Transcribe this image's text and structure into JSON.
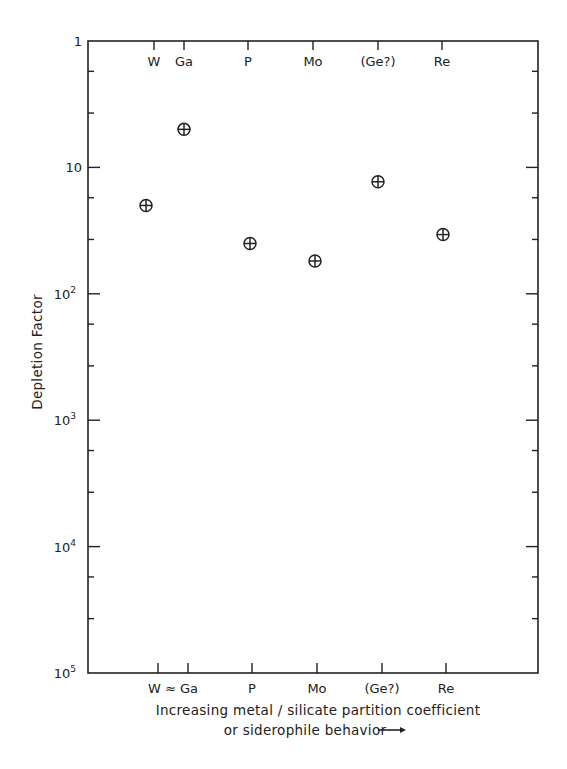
{
  "chart_data": {
    "type": "scatter",
    "title": "",
    "ylabel": "Depletion Factor",
    "xlabel_line1": "Increasing metal / silicate partition coefficient",
    "xlabel_line2": "or siderophile behavior",
    "xlabel_arrow": "→",
    "yscale": "log",
    "ylim": [
      1,
      100000
    ],
    "y_inverted": true,
    "grid": false,
    "y_ticks": [
      {
        "value": 1,
        "label": "1"
      },
      {
        "value": 10,
        "label": "10"
      },
      {
        "value": 100,
        "label": "10",
        "exp": "2"
      },
      {
        "value": 1000,
        "label": "10",
        "exp": "3"
      },
      {
        "value": 10000,
        "label": "10",
        "exp": "4"
      },
      {
        "value": 100000,
        "label": "10",
        "exp": "5"
      }
    ],
    "categories": [
      "W",
      "Ga",
      "P",
      "Mo",
      "(Ge?)",
      "Re"
    ],
    "top_tick_labels": [
      "W",
      "Ga",
      "P",
      "Mo",
      "(Ge?)",
      "Re"
    ],
    "bottom_tick_labels": [
      "W ≈ Ga",
      "P",
      "Mo",
      "(Ge?)",
      "Re"
    ],
    "legend": [
      {
        "symbol": "⊕",
        "meaning": "Earth"
      },
      {
        "symbol": "☽",
        "meaning": "Moon"
      }
    ],
    "series": [
      {
        "name": "Earth",
        "symbol": "earth-cross-circle",
        "points": [
          {
            "element": "W",
            "value": 20
          },
          {
            "element": "Ga",
            "value": 5
          },
          {
            "element": "P",
            "value": 40
          },
          {
            "element": "Mo",
            "value": 55
          },
          {
            "element": "(Ge?)",
            "value": 13
          },
          {
            "element": "Re",
            "value": 34
          }
        ]
      },
      {
        "name": "Moon",
        "symbol": "crescent",
        "points": [
          {
            "element": "W",
            "value": 20,
            "double": true
          },
          {
            "element": "Ga",
            "value": 30
          },
          {
            "element": "P",
            "value": 120
          },
          {
            "element": "Mo",
            "value": 540
          },
          {
            "element": "(Ge?)",
            "value": 5100
          },
          {
            "element": "Re",
            "value": 10500
          }
        ]
      }
    ]
  },
  "colors": {
    "ink": "#222222",
    "background": "#ffffff"
  }
}
